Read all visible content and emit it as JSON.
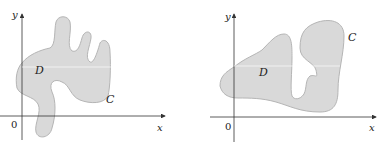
{
  "figures": [
    {
      "id": "left",
      "region_label": "D",
      "curve_label": "C",
      "axis_x_label": "x",
      "axis_y_label": "y",
      "origin_label": "0"
    },
    {
      "id": "right",
      "region_label": "D",
      "curve_label": "C",
      "axis_x_label": "x",
      "axis_y_label": "y",
      "origin_label": "0"
    }
  ],
  "colors": {
    "region_fill": "#d9d9d9",
    "region_stroke": "#b5b5b5",
    "axis": "#333333",
    "arrow": "#888888"
  }
}
